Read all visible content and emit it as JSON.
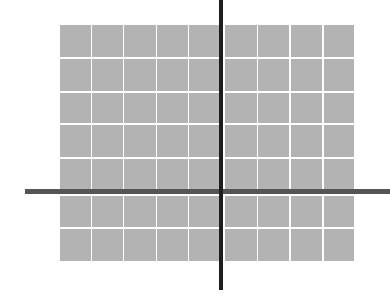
{
  "diagram": {
    "type": "grid-with-crosshair-axes",
    "background_color": "#ffffff",
    "grid": {
      "rows": 7,
      "columns": 10,
      "cell_color": "#b3b3b3",
      "gap_color": "#ffffff",
      "column_edges": [
        [
          60,
          90
        ],
        [
          92,
          122
        ],
        [
          124,
          155
        ],
        [
          157,
          187
        ],
        [
          189,
          219
        ],
        [
          225,
          256
        ],
        [
          258,
          288
        ],
        [
          291,
          321
        ],
        [
          324,
          353
        ]
      ],
      "column_edges_note": "9 visible column blocks; column 5/6 boundary covered by vertical axis",
      "row_edges": [
        [
          25,
          56
        ],
        [
          59,
          90
        ],
        [
          93,
          122
        ],
        [
          125,
          156
        ],
        [
          159,
          188
        ],
        [
          196,
          226
        ],
        [
          229,
          260
        ]
      ]
    },
    "axes": {
      "vertical": {
        "x": 219,
        "width": 4,
        "y_start": 0,
        "y_end": 290,
        "color": "#1e1e1e"
      },
      "horizontal": {
        "y": 189,
        "height": 5,
        "x_start": 25,
        "x_end": 390,
        "color": "#555555"
      }
    }
  }
}
